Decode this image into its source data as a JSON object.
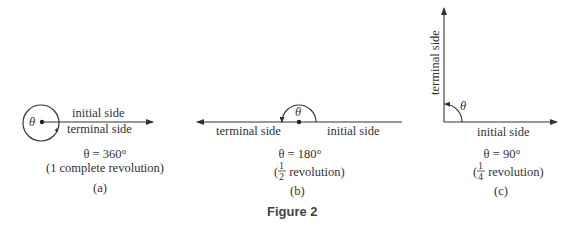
{
  "figure_caption": "Figure 2",
  "panels": [
    {
      "id": "a",
      "initial_label": "initial side",
      "terminal_label": "terminal side",
      "theta_symbol": "θ",
      "equation": "θ = 360°",
      "description": "(1 complete revolution)",
      "tag": "(a)"
    },
    {
      "id": "b",
      "initial_label": "initial side",
      "terminal_label": "terminal side",
      "theta_symbol": "θ",
      "equation": "θ = 180°",
      "desc_open": "(",
      "frac_num": "1",
      "frac_den": "2",
      "desc_rest": " revolution)",
      "tag": "(b)"
    },
    {
      "id": "c",
      "initial_label": "initial side",
      "terminal_label": "terminal side",
      "theta_symbol": "θ",
      "equation": "θ = 90°",
      "desc_open": "(",
      "frac_num": "1",
      "frac_den": "4",
      "desc_rest": " revolution)",
      "tag": "(c)"
    }
  ],
  "colors": {
    "line": "#333333",
    "text": "#333333"
  }
}
